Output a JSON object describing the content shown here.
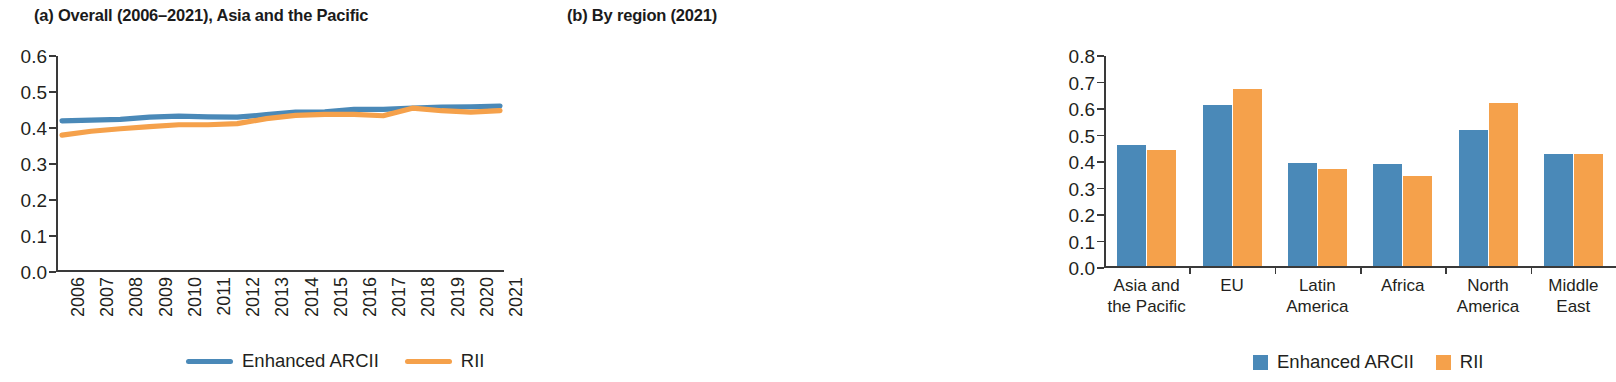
{
  "panel_a": {
    "title": "(a) Overall (2006–2021), Asia and the Pacific",
    "legend": [
      {
        "label": "Enhanced ARCII",
        "color": "#4a89b8",
        "marker": "line"
      },
      {
        "label": "RII",
        "color": "#f5a14b",
        "marker": "line"
      }
    ]
  },
  "panel_b": {
    "title": "(b) By region (2021)",
    "legend": [
      {
        "label": "Enhanced ARCII",
        "color": "#4a89b8",
        "marker": "square"
      },
      {
        "label": "RII",
        "color": "#f5a14b",
        "marker": "square"
      }
    ]
  },
  "colors": {
    "enhanced_arcii": "#4a89b8",
    "rii": "#f5a14b",
    "axis": "#3a3a3a",
    "text": "#231f20",
    "background": "#ffffff"
  },
  "chart_data": [
    {
      "type": "line",
      "title": "(a) Overall (2006–2021), Asia and the Pacific",
      "xlabel": "",
      "ylabel": "",
      "x": [
        "2006",
        "2007",
        "2008",
        "2009",
        "2010",
        "2011",
        "2012",
        "2013",
        "2014",
        "2015",
        "2016",
        "2017",
        "2018",
        "2019",
        "2020",
        "2021"
      ],
      "xtick_labels": [
        "2006",
        "2007",
        "2008",
        "2009",
        "2010",
        "2011",
        "2012",
        "2013",
        "2014",
        "2015",
        "2016",
        "2017",
        "2018",
        "2019",
        "2020",
        "2021"
      ],
      "ytick_labels": [
        "0.0",
        "0.1",
        "0.2",
        "0.3",
        "0.4",
        "0.5",
        "0.6"
      ],
      "ylim": [
        0.0,
        0.6
      ],
      "ytick_step": 0.1,
      "grid": false,
      "legend_position": "bottom",
      "series": [
        {
          "name": "Enhanced ARCII",
          "color": "#4a89b8",
          "values": [
            0.42,
            0.422,
            0.424,
            0.43,
            0.433,
            0.431,
            0.43,
            0.437,
            0.444,
            0.445,
            0.452,
            0.452,
            0.455,
            0.458,
            0.459,
            0.461
          ]
        },
        {
          "name": "RII",
          "color": "#f5a14b",
          "values": [
            0.38,
            0.391,
            0.398,
            0.404,
            0.409,
            0.409,
            0.412,
            0.426,
            0.435,
            0.438,
            0.438,
            0.434,
            0.455,
            0.448,
            0.444,
            0.448
          ]
        }
      ]
    },
    {
      "type": "bar",
      "title": "(b) By region (2021)",
      "xlabel": "",
      "ylabel": "",
      "categories": [
        "Asia and\nthe Pacific",
        "EU",
        "Latin\nAmerica",
        "Africa",
        "North\nAmerica",
        "Middle\nEast"
      ],
      "ytick_labels": [
        "0.0",
        "0.1",
        "0.2",
        "0.3",
        "0.4",
        "0.5",
        "0.6",
        "0.7",
        "0.8"
      ],
      "ylim": [
        0.0,
        0.8
      ],
      "ytick_step": 0.1,
      "grid": false,
      "legend_position": "bottom",
      "series": [
        {
          "name": "Enhanced ARCII",
          "color": "#4a89b8",
          "values": [
            0.458,
            0.61,
            0.392,
            0.385,
            0.515,
            0.425
          ]
        },
        {
          "name": "RII",
          "color": "#f5a14b",
          "values": [
            0.44,
            0.67,
            0.368,
            0.34,
            0.618,
            0.426
          ]
        }
      ]
    }
  ]
}
